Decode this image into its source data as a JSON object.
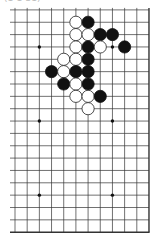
{
  "caption": "(1-1-31)",
  "board": {
    "cols": 12,
    "rows": 19,
    "origin_x": 15,
    "origin_y": 9.9,
    "col_spacing": 12.18,
    "row_spacing": 12.35,
    "edges": {
      "right": true,
      "bottom": true,
      "left": false,
      "top": false
    },
    "line_color": "#333333",
    "stone_radius": 6.1,
    "star_points": [
      [
        2,
        3
      ],
      [
        8,
        3
      ],
      [
        2,
        9
      ],
      [
        8,
        9
      ],
      [
        2,
        15
      ],
      [
        8,
        15
      ]
    ],
    "stones": [
      {
        "color": "white",
        "col": 5,
        "row": 1
      },
      {
        "color": "black",
        "col": 6,
        "row": 1
      },
      {
        "color": "white",
        "col": 5,
        "row": 2
      },
      {
        "color": "white",
        "col": 6,
        "row": 2
      },
      {
        "color": "black",
        "col": 7,
        "row": 2
      },
      {
        "color": "black",
        "col": 8,
        "row": 2
      },
      {
        "color": "white",
        "col": 5,
        "row": 3
      },
      {
        "color": "black",
        "col": 6,
        "row": 3
      },
      {
        "color": "white",
        "col": 7,
        "row": 3
      },
      {
        "color": "black",
        "col": 9,
        "row": 3
      },
      {
        "color": "white",
        "col": 4,
        "row": 4
      },
      {
        "color": "white",
        "col": 5,
        "row": 4
      },
      {
        "color": "black",
        "col": 6,
        "row": 4
      },
      {
        "color": "black",
        "col": 3,
        "row": 5
      },
      {
        "color": "white",
        "col": 4,
        "row": 5
      },
      {
        "color": "black",
        "col": 5,
        "row": 5
      },
      {
        "color": "black",
        "col": 6,
        "row": 5
      },
      {
        "color": "black",
        "col": 4,
        "row": 6
      },
      {
        "color": "white",
        "col": 5,
        "row": 6
      },
      {
        "color": "black",
        "col": 6,
        "row": 6
      },
      {
        "color": "white",
        "col": 5,
        "row": 7
      },
      {
        "color": "white",
        "col": 6,
        "row": 7
      },
      {
        "color": "black",
        "col": 7,
        "row": 7
      },
      {
        "color": "white",
        "col": 6,
        "row": 8
      }
    ]
  }
}
